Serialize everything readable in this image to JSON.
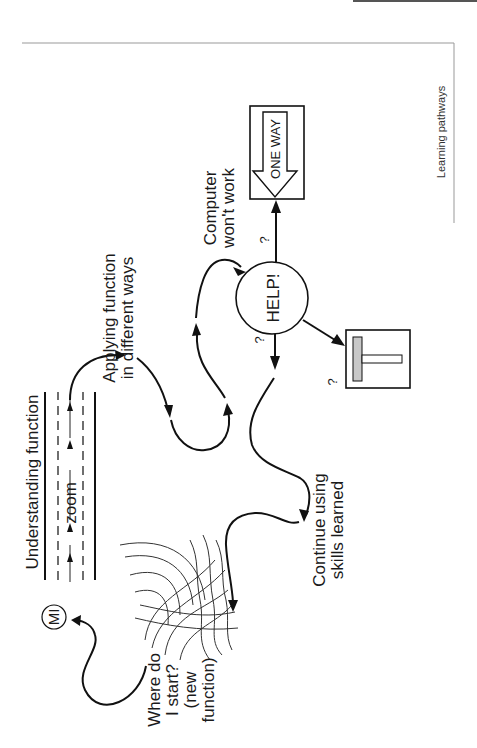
{
  "page": {
    "running_header": "Learning pathways"
  },
  "diagram": {
    "title": "Learning pathways",
    "nodes": {
      "mi": "MI",
      "where_start": [
        "Where do",
        "I start?",
        "(new",
        "function)"
      ],
      "understanding": "Understanding function",
      "zoom": "zoom",
      "applying": [
        "Applying function",
        "in different ways"
      ],
      "help": "HELP!",
      "computer": [
        "Computer",
        "won't work"
      ],
      "one_way": "ONE WAY",
      "continue": [
        "Continue using",
        "skills learned"
      ],
      "question": "?"
    },
    "colors": {
      "line": "#111111",
      "sign_fill": "#c8c8c8",
      "background": "#ffffff"
    }
  }
}
